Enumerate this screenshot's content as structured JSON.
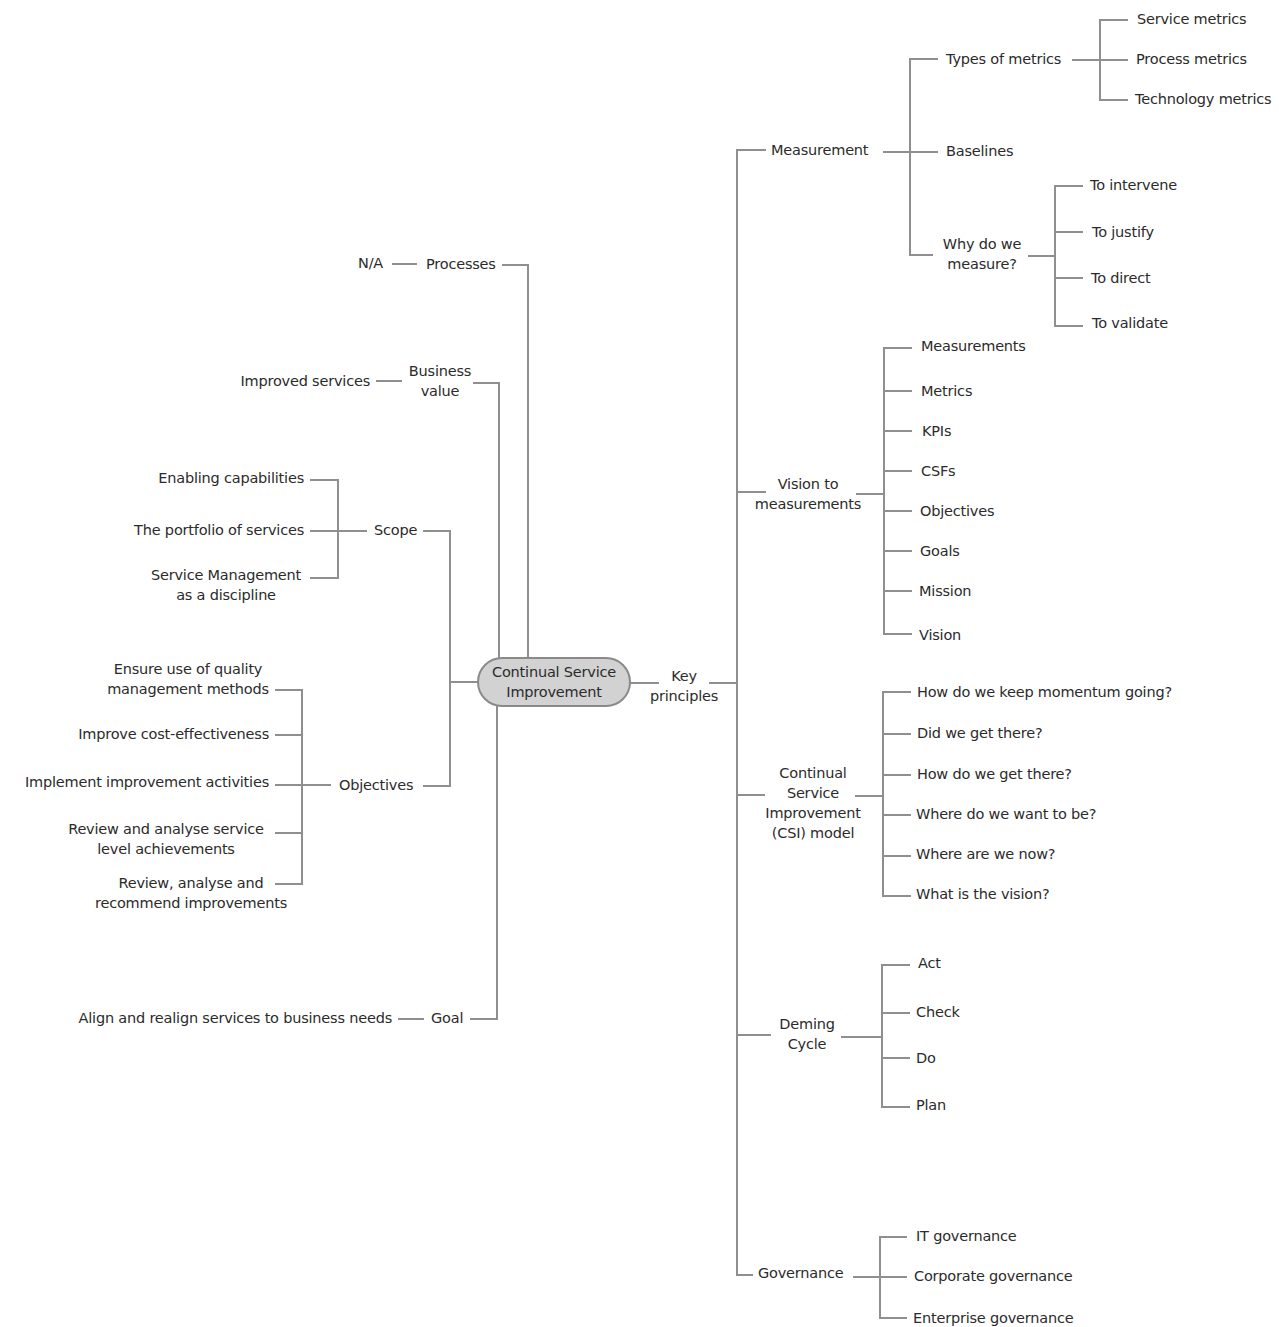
{
  "diagram": {
    "type": "mind-map",
    "line_color": "#8f8f8f",
    "root": {
      "label": "Continual Service\nImprovement",
      "fill": "#d2d2d2",
      "border": "#8a8a8a"
    },
    "left": {
      "processes": {
        "label": "Processes",
        "children": [
          "N/A"
        ]
      },
      "business_value": {
        "label": "Business\nvalue",
        "children": [
          "Improved services"
        ]
      },
      "scope": {
        "label": "Scope",
        "children": [
          "Enabling capabilities",
          "The portfolio of services",
          "Service Management\nas a discipline"
        ]
      },
      "objectives": {
        "label": "Objectives",
        "children": [
          "Ensure use of quality\nmanagement methods",
          "Improve cost-effectiveness",
          "Implement improvement activities",
          "Review and analyse service\nlevel achievements",
          "Review, analyse and\nrecommend improvements"
        ]
      },
      "goal": {
        "label": "Goal",
        "children": [
          "Align and realign services to business needs"
        ]
      }
    },
    "right": {
      "key_principles": {
        "label": "Key\nprinciples"
      },
      "measurement": {
        "label": "Measurement",
        "types_of_metrics": {
          "label": "Types of metrics",
          "children": [
            "Service metrics",
            "Process metrics",
            "Technology metrics"
          ]
        },
        "baselines": {
          "label": "Baselines"
        },
        "why_measure": {
          "label": "Why do we\nmeasure?",
          "children": [
            "To intervene",
            "To justify",
            "To direct",
            "To validate"
          ]
        }
      },
      "vision_to_measurements": {
        "label": "Vision to\nmeasurements",
        "children": [
          "Measurements",
          "Metrics",
          "KPIs",
          "CSFs",
          "Objectives",
          "Goals",
          "Mission",
          "Vision"
        ]
      },
      "csi_model": {
        "label": "Continual\nService\nImprovement\n(CSI) model",
        "children": [
          "How do we keep momentum going?",
          "Did we get there?",
          "How do we get there?",
          "Where do we want to be?",
          "Where are we now?",
          "What is the vision?"
        ]
      },
      "deming_cycle": {
        "label": "Deming\nCycle",
        "children": [
          "Act",
          "Check",
          "Do",
          "Plan"
        ]
      },
      "governance": {
        "label": "Governance",
        "children": [
          "IT governance",
          "Corporate governance",
          "Enterprise governance"
        ]
      }
    }
  }
}
